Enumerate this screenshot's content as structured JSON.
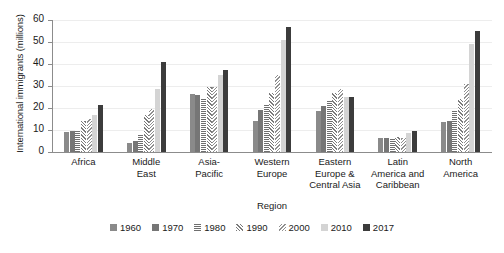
{
  "chart_data": {
    "type": "bar",
    "title": "",
    "subtitle": "",
    "xlabel": "Region",
    "ylabel": "International immigrants (millions)",
    "ylim": [
      0,
      60
    ],
    "ytick_values": [
      0,
      10,
      20,
      30,
      40,
      50,
      60
    ],
    "ytick_labels": [
      "0",
      "10",
      "20",
      "30",
      "40",
      "50",
      "60"
    ],
    "grid": true,
    "legend_position": "bottom",
    "categories": [
      "Africa",
      "Middle East",
      "Asia-Pacific",
      "Western Europe",
      "Eastern Europe & Central Asia",
      "Latin America and Caribbean",
      "North America"
    ],
    "category_lines": [
      [
        "Africa"
      ],
      [
        "Middle",
        "East"
      ],
      [
        "Asia-",
        "Pacific"
      ],
      [
        "Western",
        "Europe"
      ],
      [
        "Eastern",
        "Europe &",
        "Central Asia"
      ],
      [
        "Latin",
        "America and",
        "Caribbean"
      ],
      [
        "North",
        "America"
      ]
    ],
    "series": [
      {
        "name": "1960",
        "color": "#8a8a8a",
        "fill": "solid",
        "values": [
          9.0,
          3.9,
          26.5,
          14.0,
          18.5,
          6.2,
          13.5
        ]
      },
      {
        "name": "1970",
        "color": "#767676",
        "fill": "solid",
        "values": [
          9.4,
          5.0,
          26.0,
          19.0,
          21.0,
          6.3,
          14.0
        ]
      },
      {
        "name": "1980",
        "color": "#6f6f6f",
        "fill": "horizontal",
        "values": [
          10.0,
          8.0,
          24.5,
          22.0,
          23.0,
          6.3,
          18.5
        ]
      },
      {
        "name": "1990",
        "color": "#7a7a7a",
        "fill": "diagonal-up",
        "values": [
          14.0,
          17.0,
          29.5,
          27.0,
          27.0,
          7.0,
          24.0
        ]
      },
      {
        "name": "2000",
        "color": "#8f8f8f",
        "fill": "diagonal-dn",
        "values": [
          15.0,
          19.5,
          29.5,
          35.0,
          28.5,
          6.5,
          31.0
        ]
      },
      {
        "name": "2010",
        "color": "#d4d4d4",
        "fill": "solid",
        "values": [
          17.0,
          28.8,
          35.0,
          51.0,
          25.0,
          8.5,
          49.0
        ]
      },
      {
        "name": "2017",
        "color": "#3c3c3c",
        "fill": "solid",
        "values": [
          21.5,
          41.0,
          37.5,
          57.0,
          25.0,
          9.5,
          55.0
        ]
      }
    ]
  },
  "legend": {
    "items": [
      {
        "label": "1960"
      },
      {
        "label": "1970"
      },
      {
        "label": "1980"
      },
      {
        "label": "1990"
      },
      {
        "label": "2000"
      },
      {
        "label": "2010"
      },
      {
        "label": "2017"
      }
    ]
  }
}
